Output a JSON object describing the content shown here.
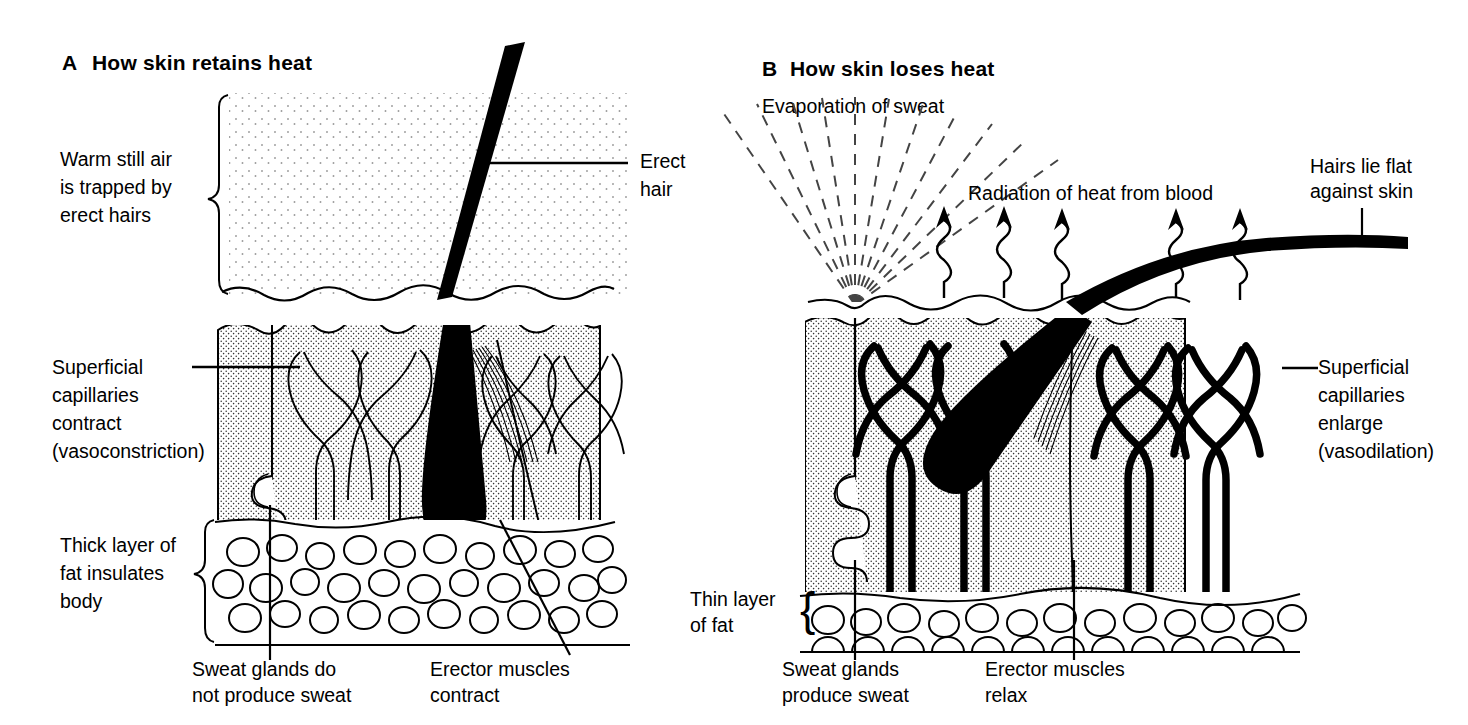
{
  "figure": {
    "kind": "biology-diagram",
    "ink_color": "#000000",
    "paper_color": "#ffffff",
    "stipple_color": "#8d8d8d"
  },
  "panel_a": {
    "letter": "A",
    "title": "How skin retains heat",
    "labels": {
      "air": [
        "Warm still air",
        "is trapped by",
        "erect hairs"
      ],
      "hair": [
        "Erect",
        "hair"
      ],
      "capillaries": [
        "Superficial",
        "capillaries",
        "contract",
        "(vasoconstriction)"
      ],
      "fat": [
        "Thick layer of",
        "fat insulates",
        "body"
      ],
      "sweat": [
        "Sweat glands do",
        "not produce sweat"
      ],
      "erector": [
        "Erector  muscles",
        "contract"
      ]
    }
  },
  "panel_b": {
    "letter": "B",
    "title": "How skin loses heat",
    "labels": {
      "evaporation": "Evaporation of sweat",
      "radiation": "Radiation of heat from blood",
      "hair": [
        "Hairs lie flat",
        "against skin"
      ],
      "capillaries": [
        "Superficial",
        "capillaries",
        "enlarge",
        "(vasodilation)"
      ],
      "fat": [
        "Thin layer",
        "of fat"
      ],
      "sweat": [
        "Sweat glands",
        "produce sweat"
      ],
      "erector": [
        "Erector  muscles",
        "relax"
      ]
    }
  }
}
